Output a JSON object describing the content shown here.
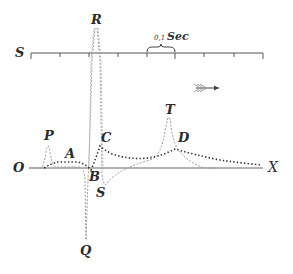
{
  "diagram": {
    "type": "electrocardiogram-waveform",
    "time_scale": {
      "axis_label": "S",
      "scale_label_prefix": "0,1",
      "scale_label_unit": "Sec",
      "tick_count": 9
    },
    "baseline": {
      "origin_label": "O",
      "end_label": "X"
    },
    "wave_labels": {
      "P": "P",
      "A": "A",
      "R": "R",
      "B": "B",
      "C": "C",
      "S": "S",
      "Q": "Q",
      "T": "T",
      "D": "D"
    },
    "direction_indicator": "arrow-right",
    "colors": {
      "ink": "#2a2a2a",
      "dashed_curve": "#9a9a9a",
      "dotted_curve": "#333333",
      "axis": "#555555",
      "background": "#ffffff"
    }
  }
}
